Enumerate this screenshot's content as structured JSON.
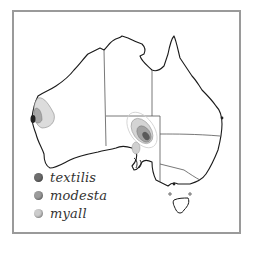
{
  "map": {
    "subject": "Australia distribution map",
    "regions": [
      "Western Australia",
      "Northern Territory",
      "South Australia",
      "Queensland",
      "New South Wales",
      "Victoria",
      "Tasmania"
    ]
  },
  "legend": {
    "items": [
      {
        "label": "textilis",
        "color": "#6e6e6e"
      },
      {
        "label": "modesta",
        "color": "#9c9c9c"
      },
      {
        "label": "myall",
        "color": "#cdcdcd"
      }
    ]
  },
  "colors": {
    "frame": "#9a9a9a",
    "coast": "#1a1a1a",
    "border": "#555555",
    "textilis": "#6e6e6e",
    "modesta": "#9c9c9c",
    "myall": "#cdcdcd"
  }
}
